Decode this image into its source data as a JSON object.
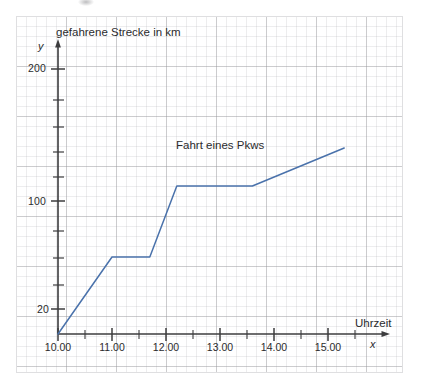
{
  "chart_data": {
    "type": "line",
    "title": "",
    "annotations": [
      {
        "text": "Fahrt eines Pkws",
        "x": 12.35,
        "y": 150
      }
    ],
    "xlabel": "Uhrzeit",
    "ylabel": "gefahrene Strecke in km",
    "x_axis_letter": "x",
    "y_axis_letter": "y",
    "xlim": [
      10.0,
      15.6
    ],
    "ylim": [
      10,
      260
    ],
    "y_scale": "log-like",
    "grid": true,
    "legend": null,
    "x_tick_labels": [
      "10.00",
      "11.00",
      "12.00",
      "13.00",
      "14.00",
      "15.00"
    ],
    "x_tick_values": [
      10,
      11,
      12,
      13,
      14,
      15
    ],
    "x_minor_tick_values": [
      10.5,
      11.5,
      12.5,
      13.5,
      14.5,
      15.5
    ],
    "y_tick_labels": [
      "20",
      "100",
      "200"
    ],
    "y_tick_values": [
      20,
      100,
      200
    ],
    "y_minor_tick_values": [
      30,
      45,
      65,
      140,
      170,
      230
    ],
    "series": [
      {
        "name": "Fahrt eines Pkws",
        "color": "#4a72ab",
        "x": [
          10.0,
          11.0,
          11.7,
          12.2,
          13.6,
          15.3
        ],
        "y": [
          10,
          50,
          50,
          120,
          120,
          160
        ]
      }
    ]
  },
  "labels": {
    "y_axis_title": "gefahrene Strecke in km",
    "y_axis_letter": "y",
    "x_axis_title": "Uhrzeit",
    "x_axis_letter": "x",
    "annotation": "Fahrt eines Pkws",
    "y_200": "200",
    "y_100": "100",
    "y_20": "20",
    "x_10": "10.00",
    "x_11": "11.00",
    "x_12": "12.00",
    "x_13": "13.00",
    "x_14": "14.00",
    "x_15": "15.00"
  },
  "colors": {
    "series_line": "#4a72ab",
    "axis": "#3c3c3e",
    "grid_major": "#96969b",
    "grid_minor": "#a5a5ac",
    "text": "#2b2b2d",
    "paper": "#ffffff"
  }
}
